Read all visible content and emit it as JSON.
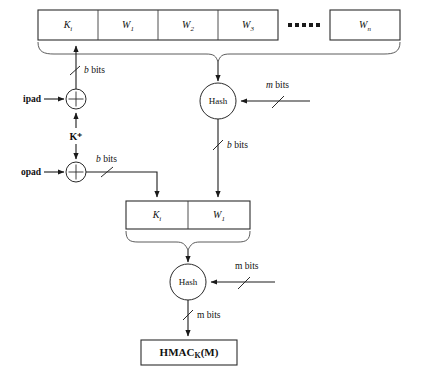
{
  "diagram": {
    "top_blocks": [
      {
        "name": "K_i",
        "base": "K",
        "sub": "i",
        "x": 38,
        "w": 60
      },
      {
        "name": "W_1",
        "base": "W",
        "sub": "1",
        "x": 98,
        "w": 60
      },
      {
        "name": "W_2",
        "base": "W",
        "sub": "2",
        "x": 158,
        "w": 60
      },
      {
        "name": "W_3",
        "base": "W",
        "sub": "3",
        "x": 218,
        "w": 60
      },
      {
        "name": "W_n",
        "base": "W",
        "sub": "n",
        "x": 330,
        "w": 70
      }
    ],
    "ellipsis": "▪ ▪ ▪ ▪ ▪",
    "mid_blocks": [
      {
        "name": "K_i",
        "base": "K",
        "sub": "i",
        "x": 126,
        "w": 62
      },
      {
        "name": "W_1",
        "base": "W",
        "sub": "1",
        "x": 188,
        "w": 62
      }
    ],
    "labels": {
      "ipad": "ipad",
      "opad": "opad",
      "k_plus": "K⁺",
      "hash_top": "Hash",
      "hash_bottom": "Hash",
      "b_bits_ipad": {
        "it": "b",
        "rest": " bits"
      },
      "b_bits_opad": {
        "it": "b",
        "rest": " bits"
      },
      "m_bits_top": {
        "it": "m",
        "rest": " bits"
      },
      "b_bits_hash_out": {
        "it": "b",
        "rest": " bits"
      },
      "m_bits_bottom_in": {
        "it": "",
        "rest": "m bits"
      },
      "m_bits_output": {
        "it": "",
        "rest": "m bits"
      },
      "output": {
        "base": "HMAC",
        "sub": "K",
        "tail": "(M)"
      }
    },
    "colors": {
      "line": "#2a2a2a",
      "text": "#111111",
      "background": "#ffffff"
    }
  }
}
